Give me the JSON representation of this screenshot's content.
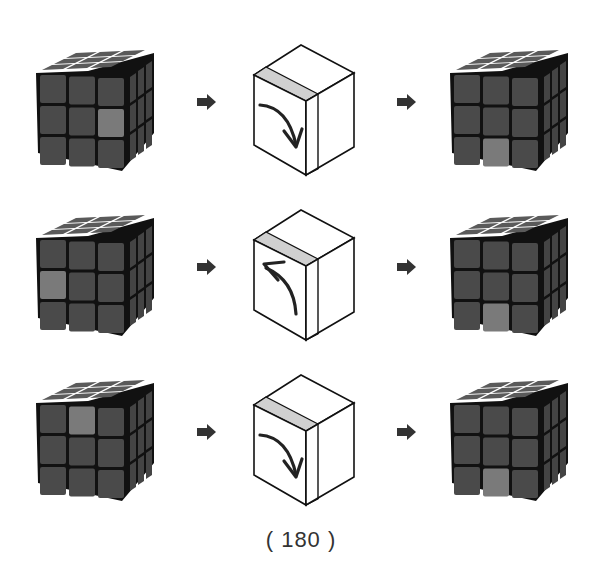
{
  "caption": "( 180 )",
  "colors": {
    "sticker_dark": "#4a4a4a",
    "sticker_light": "#7a7a7a",
    "cube_border": "#111111",
    "move_strip": "#d0d0d0",
    "arrow": "#333333"
  },
  "steps": [
    {
      "before": {
        "highlight_face": "front",
        "highlight_pos": "middle-right"
      },
      "move": {
        "label": "R-turn",
        "direction": "down",
        "layer": "right"
      },
      "after": {
        "highlight_face": "front",
        "highlight_pos": "bottom-middle"
      }
    },
    {
      "before": {
        "highlight_face": "front",
        "highlight_pos": "middle-left"
      },
      "move": {
        "label": "R'-turn",
        "direction": "up",
        "layer": "right"
      },
      "after": {
        "highlight_face": "front",
        "highlight_pos": "bottom-middle"
      }
    },
    {
      "before": {
        "highlight_face": "front",
        "highlight_pos": "top-middle"
      },
      "move": {
        "label": "R-turn",
        "direction": "down",
        "layer": "right"
      },
      "after": {
        "highlight_face": "front",
        "highlight_pos": "bottom-middle"
      }
    }
  ]
}
